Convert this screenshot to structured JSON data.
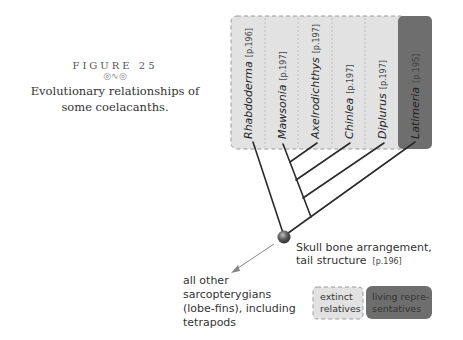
{
  "caption": {
    "figure_label": "FIGURE 25",
    "ornament": "◎∿◎",
    "text": "Evolutionary relationships of some coelacanths."
  },
  "taxa": [
    {
      "name": "Rhabdoderma",
      "page": "[p.196]",
      "status": "extinct"
    },
    {
      "name": "Mawsonia",
      "page": "[p.197]",
      "status": "extinct"
    },
    {
      "name": "Axelrodichthys",
      "page": "[p.197]",
      "status": "extinct"
    },
    {
      "name": "Chinlea",
      "page": "[p.197]",
      "status": "extinct"
    },
    {
      "name": "Diplurus",
      "page": "[p.197]",
      "status": "extinct"
    },
    {
      "name": "Latimeria",
      "page": "[p.195]",
      "status": "living"
    }
  ],
  "node": {
    "line1": "Skull bone arrangement,",
    "line2": "tail structure",
    "page": "[p.196]"
  },
  "outgroup": {
    "lines": [
      "all other",
      "sarcopterygians",
      "(lobe-fins), including",
      "tetrapods"
    ]
  },
  "legend": {
    "extinct_line1": "extinct",
    "extinct_line2": "relatives",
    "living_line1": "living repre-",
    "living_line2": "sentatives"
  },
  "colors": {
    "extinct_fill": "#e2e2e2",
    "living_fill": "#6e6e6e",
    "node": "#555555"
  }
}
